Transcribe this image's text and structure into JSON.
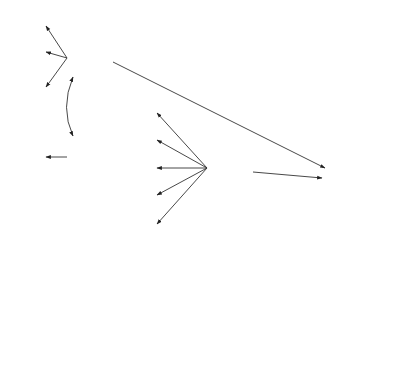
{
  "diagram": {
    "type": "structural-equation-model",
    "latent": [
      {
        "id": "APT",
        "label": "APT",
        "cx": 90,
        "cy": 58,
        "r": 23
      },
      {
        "id": "FIELD",
        "label": "FIELD",
        "cx": 90,
        "cy": 157,
        "r": 23
      },
      {
        "id": "STRA",
        "label": "STRA",
        "cx": 230,
        "cy": 168,
        "r": 23
      },
      {
        "id": "ACH",
        "label": "ACH",
        "cx": 345,
        "cy": 180,
        "r": 23
      },
      {
        "id": "ATTS",
        "label": "ATTS",
        "cx": 108,
        "cy": 293,
        "r": 23
      },
      {
        "id": "MOT",
        "label": "MOT",
        "cx": 230,
        "cy": 293,
        "r": 23
      },
      {
        "id": "CONF",
        "label": "CONF",
        "cx": 323,
        "cy": 300,
        "r": 23
      }
    ],
    "observed": [
      {
        "id": "SC",
        "label": "SC",
        "x": 18,
        "y": 14,
        "w": 27,
        "h": 15,
        "factor": "APT",
        "loading": ".60"
      },
      {
        "id": "WS",
        "label": "WS",
        "x": 18,
        "y": 44,
        "w": 27,
        "h": 15,
        "factor": "APT",
        "loading": ".69"
      },
      {
        "id": "PA",
        "label": "PA",
        "x": 18,
        "y": 78,
        "w": 27,
        "h": 15,
        "factor": "APT",
        "loading": ".35"
      },
      {
        "id": "GEF",
        "label": "GEF",
        "x": 18,
        "y": 150,
        "w": 27,
        "h": 15,
        "factor": "FIELD",
        "loading": "1.00"
      },
      {
        "id": "LS1",
        "label": "LS1",
        "x": 129,
        "y": 103,
        "w": 27,
        "h": 15,
        "factor": "STRA",
        "loading": ".65"
      },
      {
        "id": "LS2",
        "label": "LS2",
        "x": 129,
        "y": 131,
        "w": 27,
        "h": 15,
        "factor": "STRA",
        "loading": ".90"
      },
      {
        "id": "LS4",
        "label": "LS4",
        "x": 129,
        "y": 160,
        "w": 27,
        "h": 15,
        "factor": "STRA",
        "loading": ".85"
      },
      {
        "id": "LS5",
        "label": "LS5",
        "x": 129,
        "y": 188,
        "w": 27,
        "h": 15,
        "factor": "STRA",
        "loading": ".64"
      },
      {
        "id": "LS6",
        "label": "LS6",
        "x": 129,
        "y": 216,
        "w": 27,
        "h": 15,
        "factor": "STRA",
        "loading": ".66"
      },
      {
        "id": "THM",
        "label": "THM",
        "x": 366,
        "y": 120,
        "w": 27,
        "h": 15,
        "factor": "ACH",
        "loading": ".77"
      },
      {
        "id": "FAT",
        "label": "FAT",
        "x": 366,
        "y": 147,
        "w": 27,
        "h": 15,
        "factor": "ACH",
        "loading": ".95"
      },
      {
        "id": "CAT",
        "label": "CAT",
        "x": 366,
        "y": 174,
        "w": 27,
        "h": 15,
        "factor": "ACH",
        "loading": ".70"
      },
      {
        "id": "CZE",
        "label": "CZE",
        "x": 366,
        "y": 201,
        "w": 27,
        "h": 15,
        "factor": "ACH",
        "loading": ".74"
      },
      {
        "id": "GRA",
        "label": "GRA",
        "x": 366,
        "y": 228,
        "w": 27,
        "h": 15,
        "factor": "ACH",
        "loading": ".52"
      },
      {
        "id": "FTE",
        "label": "FTE",
        "x": 18,
        "y": 213,
        "w": 27,
        "h": 15,
        "factor": "ATTS",
        "loading": ".39"
      },
      {
        "id": "FCE",
        "label": "FCE",
        "x": 18,
        "y": 240,
        "w": 27,
        "h": 15,
        "factor": "ATTS",
        "loading": ".70"
      },
      {
        "id": "AFC",
        "label": "AFC",
        "x": 18,
        "y": 266,
        "w": 27,
        "h": 15,
        "factor": "ATTS",
        "loading": ".27"
      },
      {
        "id": "IFL",
        "label": "IFL",
        "x": 18,
        "y": 291,
        "w": 27,
        "h": 15,
        "factor": "ATTS",
        "loading": ".59"
      },
      {
        "id": "INT",
        "label": "INT",
        "x": 18,
        "y": 318,
        "w": 27,
        "h": 15,
        "factor": "ATTS",
        "loading": ".39"
      },
      {
        "id": "ALF",
        "label": "ALF",
        "x": 153,
        "y": 318,
        "w": 27,
        "h": 15,
        "factor": "MOT",
        "loading": ".90"
      },
      {
        "id": "MIT",
        "label": "MIT",
        "x": 195,
        "y": 318,
        "w": 27,
        "h": 15,
        "factor": "MOT",
        "loading": ".68"
      },
      {
        "id": "DLF",
        "label": "DLF",
        "x": 237,
        "y": 318,
        "w": 27,
        "h": 15,
        "factor": "MOT",
        "loading": ".93"
      },
      {
        "id": "ANX",
        "label": "ANX",
        "x": 268,
        "y": 353,
        "w": 27,
        "h": 15,
        "factor": "CONF",
        "loading": ".91"
      },
      {
        "id": "CFD",
        "label": "CFD",
        "x": 310,
        "y": 353,
        "w": 27,
        "h": 15,
        "factor": "CONF",
        "loading": ".95"
      },
      {
        "id": "CDO",
        "label": "CDO",
        "x": 352,
        "y": 353,
        "w": 27,
        "h": 15,
        "factor": "CONF",
        "loading": ".81"
      }
    ],
    "paths": [
      {
        "from": "APT",
        "to": "ACH",
        "coef": ".47"
      },
      {
        "from": "STRA",
        "to": "ACH",
        "coef": ".29"
      },
      {
        "from": "MOT",
        "to": "STRA",
        "coef": ".48"
      },
      {
        "from": "MOT",
        "to": "ACH",
        "coef": ".48"
      },
      {
        "from": "ATTS",
        "to": "MOT",
        "coef": ".96"
      },
      {
        "from": "MOT",
        "to": "CONF",
        "coef": ".31"
      },
      {
        "from": "ACH",
        "to": "CONF",
        "coef": ".60"
      }
    ],
    "correlations": [
      {
        "a": "APT",
        "b": "FIELD",
        "coef": ".38"
      }
    ]
  },
  "labels": {
    "APT": "APT",
    "FIELD": "FIELD",
    "STRA": "STRA",
    "ACH": "ACH",
    "ATTS": "ATTS",
    "MOT": "MOT",
    "CONF": "CONF",
    "SC": "SC",
    "WS": "WS",
    "PA": "PA",
    "GEF": "GEF",
    "LS1": "LS1",
    "LS2": "LS2",
    "LS4": "LS4",
    "LS5": "LS5",
    "LS6": "LS6",
    "THM": "THM",
    "FAT": "FAT",
    "CAT": "CAT",
    "CZE": "CZE",
    "GRA": "GRA",
    "FTE": "FTE",
    "FCE": "FCE",
    "AFC": "AFC",
    "IFL": "IFL",
    "INT": "INT",
    "ALF": "ALF",
    "MIT": "MIT",
    "DLF": "DLF",
    "ANX": "ANX",
    "CFD": "CFD",
    "CDO": "CDO"
  },
  "coefs": {
    "SC": ".60",
    "WS": ".69",
    "PA": ".35",
    "APT_FIELD": ".38",
    "GEF": "1.00",
    "LS1": ".65",
    "LS2": ".90",
    "LS4": ".85",
    "LS5": ".64",
    "LS6": ".66",
    "THM": ".77",
    "FAT": ".95",
    "CAT": ".70",
    "CZE": ".74",
    "GRA": ".52",
    "FTE": ".39",
    "FCE": ".70",
    "AFC": ".27",
    "IFL": ".59",
    "INT": ".39",
    "ALF": ".90",
    "MIT": ".68",
    "DLF": ".93",
    "ANX": ".91",
    "CFD": ".95",
    "CDO": ".81",
    "APT_ACH": ".47",
    "STRA_ACH": ".29",
    "MOT_STRA": ".48",
    "MOT_ACH": ".48",
    "ATTS_MOT": ".96",
    "MOT_CONF": ".31",
    "ACH_CONF": ".60"
  }
}
